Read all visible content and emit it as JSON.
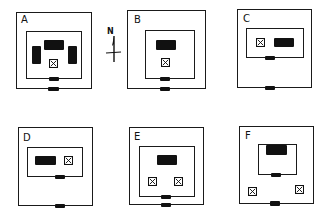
{
  "figure": {
    "north_label": "N",
    "panels": [
      {
        "id": "A",
        "label": "A"
      },
      {
        "id": "B",
        "label": "B"
      },
      {
        "id": "C",
        "label": "C"
      },
      {
        "id": "D",
        "label": "D"
      },
      {
        "id": "E",
        "label": "E"
      },
      {
        "id": "F",
        "label": "F"
      }
    ],
    "legend_semantics": {
      "outer-square": "enclosure wall",
      "inner-rectangle": "inner court",
      "black-rectangle": "building",
      "crossed-square": "altar/shrine",
      "black-bar": "gateway"
    },
    "colors": {
      "ink": "#111111",
      "paper": "#ffffff"
    }
  }
}
